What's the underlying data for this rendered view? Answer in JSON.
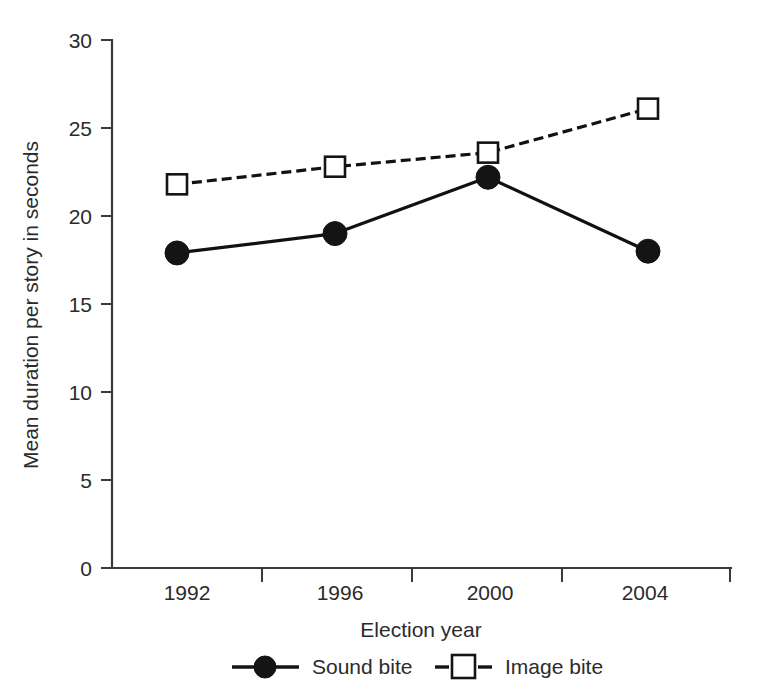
{
  "chart_data": {
    "type": "line",
    "title": "",
    "xlabel": "Election year",
    "ylabel": "Mean duration per story in seconds",
    "categories": [
      "1992",
      "1996",
      "2000",
      "2004"
    ],
    "yticks": [
      "0",
      "5",
      "10",
      "15",
      "20",
      "25",
      "30"
    ],
    "ylim": [
      0,
      30
    ],
    "grid": false,
    "legend_position": "bottom",
    "series": [
      {
        "name": "Sound bite",
        "values": [
          17.9,
          19.0,
          22.2,
          18.0
        ],
        "marker": "filled-circle",
        "line_style": "solid",
        "color": "#141414"
      },
      {
        "name": "Image bite",
        "values": [
          21.8,
          22.8,
          23.6,
          26.1
        ],
        "marker": "open-square",
        "line_style": "dashed",
        "color": "#141414"
      }
    ]
  },
  "legend": {
    "items": [
      {
        "label": "Sound bite",
        "marker": "filled-circle-icon",
        "line_style": "solid"
      },
      {
        "label": "Image bite",
        "marker": "open-square-icon",
        "line_style": "dashed"
      }
    ]
  },
  "axes": {
    "y_title": "Mean duration per story in seconds",
    "x_title": "Election year"
  },
  "colors": {
    "axis": "#3a3a3a",
    "series": "#141414",
    "text": "#2b2b2b",
    "background": "#ffffff"
  }
}
